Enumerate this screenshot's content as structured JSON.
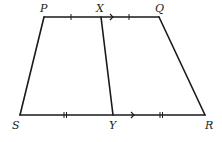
{
  "diagram": {
    "type": "trapezoid",
    "stroke_color": "#1a1a1a",
    "background": "#ffffff",
    "points": {
      "P": {
        "label": "P",
        "x": 44,
        "y": 17
      },
      "X": {
        "label": "X",
        "x": 101,
        "y": 17
      },
      "Q": {
        "label": "Q",
        "x": 159,
        "y": 17
      },
      "S": {
        "label": "S",
        "x": 20,
        "y": 115
      },
      "Y": {
        "label": "Y",
        "x": 113,
        "y": 115
      },
      "R": {
        "label": "R",
        "x": 205,
        "y": 115
      }
    },
    "segments": [
      {
        "from": "P",
        "to": "Q"
      },
      {
        "from": "S",
        "to": "R"
      },
      {
        "from": "P",
        "to": "S"
      },
      {
        "from": "Q",
        "to": "R"
      },
      {
        "from": "X",
        "to": "Y"
      }
    ],
    "markings": {
      "single_ticks": [
        "PX",
        "XQ"
      ],
      "double_ticks": [
        "SY",
        "YR"
      ],
      "parallel_arrows": [
        "PQ",
        "SR"
      ]
    }
  }
}
